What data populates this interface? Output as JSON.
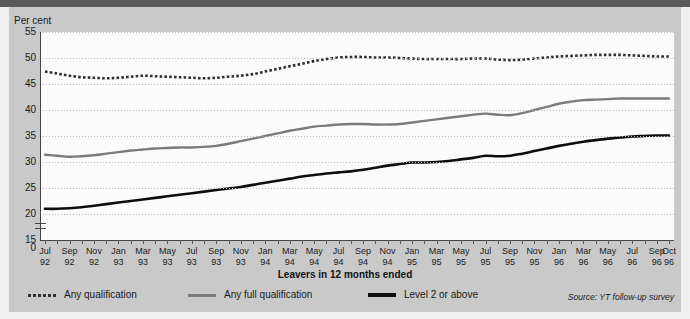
{
  "figure": {
    "y_axis_title": "Per cent",
    "x_axis_title": "Leavers in 12 months ended",
    "source": "Source: YT follow-up survey"
  },
  "legend": [
    {
      "label": "Any qualification",
      "style": "dotted",
      "color": "#303030"
    },
    {
      "label": "Any full qualification",
      "style": "grey",
      "color": "#7b7b7b"
    },
    {
      "label": "Level 2 or above",
      "style": "black",
      "color": "#0d0d0d"
    }
  ],
  "chart_data": {
    "type": "line",
    "title": "",
    "xlabel": "Leavers in 12 months ended",
    "ylabel": "Per cent",
    "ylim": [
      15,
      55
    ],
    "y_axis_break_below": 15,
    "yticks": [
      0,
      15,
      20,
      25,
      30,
      35,
      40,
      45,
      50,
      55
    ],
    "grid": true,
    "legend_position": "bottom-left",
    "x": [
      "Jul 92",
      "Aug 92",
      "Sep 92",
      "Oct 92",
      "Nov 92",
      "Dec 92",
      "Jan 93",
      "Feb 93",
      "Mar 93",
      "Apr 93",
      "May 93",
      "Jun 93",
      "Jul 93",
      "Aug 93",
      "Sep 93",
      "Oct 93",
      "Nov 93",
      "Dec 93",
      "Jan 94",
      "Feb 94",
      "Mar 94",
      "Apr 94",
      "May 94",
      "Jun 94",
      "Jul 94",
      "Aug 94",
      "Sep 94",
      "Oct 94",
      "Nov 94",
      "Dec 94",
      "Jan 95",
      "Feb 95",
      "Mar 95",
      "Apr 95",
      "May 95",
      "Jun 95",
      "Jul 95",
      "Aug 95",
      "Sep 95",
      "Oct 95",
      "Nov 95",
      "Dec 95",
      "Jan 96",
      "Feb 96",
      "Mar 96",
      "Apr 96",
      "May 96",
      "Jun 96",
      "Jul 96",
      "Aug 96",
      "Sep 96",
      "Oct 96"
    ],
    "xticklabels": [
      {
        "index": 0,
        "line1": "Jul",
        "line2": "92"
      },
      {
        "index": 2,
        "line1": "Sep",
        "line2": "92"
      },
      {
        "index": 4,
        "line1": "Nov",
        "line2": "92"
      },
      {
        "index": 6,
        "line1": "Jan",
        "line2": "93"
      },
      {
        "index": 8,
        "line1": "Mar",
        "line2": "93"
      },
      {
        "index": 10,
        "line1": "May",
        "line2": "93"
      },
      {
        "index": 12,
        "line1": "Jul",
        "line2": "93"
      },
      {
        "index": 14,
        "line1": "Sep",
        "line2": "93"
      },
      {
        "index": 16,
        "line1": "Nov",
        "line2": "93"
      },
      {
        "index": 18,
        "line1": "Jan",
        "line2": "94"
      },
      {
        "index": 20,
        "line1": "Mar",
        "line2": "94"
      },
      {
        "index": 22,
        "line1": "May",
        "line2": "94"
      },
      {
        "index": 24,
        "line1": "Jul",
        "line2": "94"
      },
      {
        "index": 26,
        "line1": "Sep",
        "line2": "94"
      },
      {
        "index": 28,
        "line1": "Nov",
        "line2": "94"
      },
      {
        "index": 30,
        "line1": "Jan",
        "line2": "95"
      },
      {
        "index": 32,
        "line1": "Mar",
        "line2": "95"
      },
      {
        "index": 34,
        "line1": "May",
        "line2": "95"
      },
      {
        "index": 36,
        "line1": "Jul",
        "line2": "95"
      },
      {
        "index": 38,
        "line1": "Sep",
        "line2": "95"
      },
      {
        "index": 40,
        "line1": "Nov",
        "line2": "95"
      },
      {
        "index": 42,
        "line1": "Jan",
        "line2": "96"
      },
      {
        "index": 44,
        "line1": "Mar",
        "line2": "96"
      },
      {
        "index": 46,
        "line1": "May",
        "line2": "96"
      },
      {
        "index": 48,
        "line1": "Jul",
        "line2": "96"
      },
      {
        "index": 50,
        "line1": "Sep",
        "line2": "96"
      },
      {
        "index": 51,
        "line1": "Oct",
        "line2": "96"
      }
    ],
    "series": [
      {
        "name": "Any qualification",
        "style": "dotted",
        "color": "#303030",
        "values": [
          47.4,
          47.0,
          46.6,
          46.3,
          46.2,
          46.1,
          46.2,
          46.4,
          46.6,
          46.5,
          46.4,
          46.3,
          46.2,
          46.1,
          46.2,
          46.4,
          46.6,
          46.9,
          47.4,
          47.9,
          48.4,
          48.9,
          49.4,
          49.8,
          50.1,
          50.2,
          50.2,
          50.1,
          50.1,
          50.0,
          49.9,
          49.8,
          49.8,
          49.8,
          49.8,
          49.9,
          49.9,
          49.7,
          49.6,
          49.7,
          49.9,
          50.1,
          50.3,
          50.4,
          50.5,
          50.6,
          50.6,
          50.6,
          50.5,
          50.4,
          50.3,
          50.3
        ]
      },
      {
        "name": "Any full qualification",
        "style": "grey",
        "color": "#7b7b7b",
        "values": [
          31.4,
          31.2,
          31.0,
          31.1,
          31.3,
          31.6,
          31.9,
          32.2,
          32.4,
          32.6,
          32.7,
          32.8,
          32.8,
          32.9,
          33.1,
          33.5,
          34.0,
          34.5,
          35.0,
          35.5,
          36.0,
          36.4,
          36.8,
          37.0,
          37.2,
          37.3,
          37.3,
          37.2,
          37.2,
          37.3,
          37.6,
          37.9,
          38.2,
          38.5,
          38.8,
          39.1,
          39.3,
          39.1,
          39.0,
          39.4,
          40.0,
          40.6,
          41.2,
          41.6,
          41.9,
          42.0,
          42.1,
          42.2,
          42.2,
          42.2,
          42.2,
          42.2
        ]
      },
      {
        "name": "Level 2 or above",
        "style": "black",
        "color": "#0d0d0d",
        "values": [
          21.0,
          21.0,
          21.1,
          21.3,
          21.6,
          21.9,
          22.2,
          22.5,
          22.8,
          23.1,
          23.4,
          23.7,
          24.0,
          24.3,
          24.6,
          24.9,
          25.2,
          25.6,
          26.0,
          26.4,
          26.8,
          27.2,
          27.5,
          27.8,
          28.0,
          28.2,
          28.5,
          28.9,
          29.3,
          29.6,
          29.9,
          29.9,
          30.0,
          30.2,
          30.5,
          30.8,
          31.2,
          31.1,
          31.2,
          31.6,
          32.1,
          32.6,
          33.1,
          33.5,
          33.9,
          34.2,
          34.5,
          34.7,
          34.9,
          35.0,
          35.1,
          35.1
        ]
      }
    ]
  }
}
